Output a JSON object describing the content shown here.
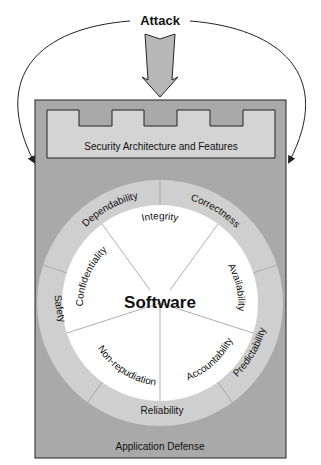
{
  "attack": {
    "label": "Attack"
  },
  "security_layer": {
    "label": "Security Architecture and Features"
  },
  "application": {
    "label": "Application Defense"
  },
  "core": {
    "label": "Software"
  },
  "inner_properties": [
    {
      "label": "Integrity"
    },
    {
      "label": "Availability"
    },
    {
      "label": "Accountability"
    },
    {
      "label": "Non-repudiation"
    },
    {
      "label": "Confidentiality"
    }
  ],
  "outer_properties": [
    {
      "label": "Dependability"
    },
    {
      "label": "Correctness"
    },
    {
      "label": "Predictability"
    },
    {
      "label": "Reliability"
    },
    {
      "label": "Safety"
    }
  ],
  "colors": {
    "outer_box": "#a9a9a9",
    "castle": "#d4d4d4",
    "ring": "#cfcfcf",
    "inner": "#ffffff",
    "arrow": "#b8b8b8",
    "stroke": "#222222"
  }
}
